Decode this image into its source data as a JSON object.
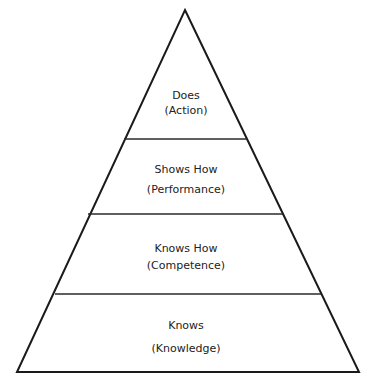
{
  "diagram": {
    "type": "pyramid",
    "colors": {
      "stroke": "#1a1a1a",
      "text": "#222222",
      "background": "#ffffff"
    },
    "tiers": [
      {
        "title": "Does",
        "subtitle": "(Action)"
      },
      {
        "title": "Shows How",
        "subtitle": "(Performance)"
      },
      {
        "title": "Knows How",
        "subtitle": "(Competence)"
      },
      {
        "title": "Knows",
        "subtitle": "(Knowledge)"
      }
    ]
  }
}
